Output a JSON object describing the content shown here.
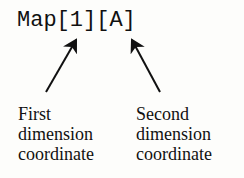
{
  "expression": "Map[1][A]",
  "labels": {
    "first": [
      "First",
      "dimension",
      "coordinate"
    ],
    "second": [
      "Second",
      "dimension",
      "coordinate"
    ]
  },
  "arrows": [
    {
      "name": "first-arrow",
      "points_to": "1"
    },
    {
      "name": "second-arrow",
      "points_to": "A"
    }
  ]
}
